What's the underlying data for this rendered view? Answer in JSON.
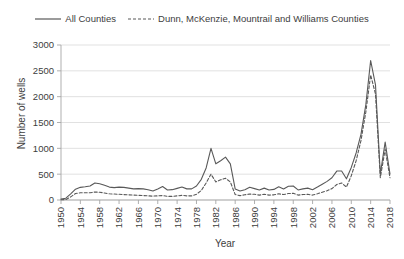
{
  "chart_data": {
    "type": "line",
    "title": "",
    "xlabel": "Year",
    "ylabel": "Number of wells",
    "xlim": [
      1950,
      2018
    ],
    "ylim": [
      0,
      3000
    ],
    "ytick_values": [
      0,
      500,
      1000,
      1500,
      2000,
      2500,
      3000
    ],
    "ytick_labels": [
      "0",
      "500",
      "1000",
      "1500",
      "2000",
      "2500",
      "3000"
    ],
    "xtick_values": [
      1950,
      1954,
      1958,
      1962,
      1966,
      1970,
      1974,
      1978,
      1982,
      1986,
      1990,
      1994,
      1998,
      2002,
      2006,
      2010,
      2014,
      2018
    ],
    "xtick_labels": [
      "1950",
      "1954",
      "1958",
      "1962",
      "1966",
      "1970",
      "1974",
      "1978",
      "1982",
      "1986",
      "1990",
      "1994",
      "1998",
      "2002",
      "2006",
      "2010",
      "2014",
      "2018"
    ],
    "grid": "horizontal",
    "legend_position": "top-center",
    "x": [
      1950,
      1951,
      1952,
      1953,
      1954,
      1955,
      1956,
      1957,
      1958,
      1959,
      1960,
      1961,
      1962,
      1963,
      1964,
      1965,
      1966,
      1967,
      1968,
      1969,
      1970,
      1971,
      1972,
      1973,
      1974,
      1975,
      1976,
      1977,
      1978,
      1979,
      1980,
      1981,
      1982,
      1983,
      1984,
      1985,
      1986,
      1987,
      1988,
      1989,
      1990,
      1991,
      1992,
      1993,
      1994,
      1995,
      1996,
      1997,
      1998,
      1999,
      2000,
      2001,
      2002,
      2003,
      2004,
      2005,
      2006,
      2007,
      2008,
      2009,
      2010,
      2011,
      2012,
      2013,
      2014,
      2015,
      2016,
      2017,
      2018
    ],
    "series": [
      {
        "name": "All Counties",
        "style": "solid",
        "color": "#595959",
        "values": [
          20,
          35,
          120,
          210,
          245,
          255,
          270,
          330,
          315,
          285,
          250,
          240,
          250,
          245,
          230,
          215,
          220,
          215,
          200,
          175,
          215,
          260,
          195,
          200,
          225,
          250,
          215,
          215,
          270,
          400,
          620,
          1000,
          700,
          760,
          830,
          700,
          215,
          175,
          200,
          245,
          220,
          195,
          230,
          195,
          205,
          255,
          215,
          265,
          270,
          195,
          215,
          230,
          200,
          250,
          305,
          360,
          430,
          560,
          560,
          410,
          630,
          910,
          1270,
          1840,
          2700,
          2230,
          500,
          1120,
          500
        ]
      },
      {
        "name": "Dunn, McKenzie, Mountrail and Williams Counties",
        "style": "dashed",
        "color": "#595959",
        "values": [
          5,
          10,
          60,
          125,
          140,
          140,
          140,
          155,
          150,
          135,
          120,
          115,
          110,
          105,
          100,
          95,
          90,
          85,
          80,
          75,
          80,
          85,
          70,
          70,
          80,
          90,
          80,
          80,
          110,
          185,
          330,
          500,
          350,
          390,
          420,
          350,
          105,
          85,
          100,
          115,
          110,
          95,
          110,
          95,
          100,
          120,
          105,
          125,
          130,
          95,
          105,
          110,
          95,
          120,
          150,
          180,
          220,
          300,
          330,
          250,
          470,
          760,
          1150,
          1700,
          2420,
          2050,
          430,
          980,
          430
        ]
      }
    ]
  },
  "legend": {
    "entries": [
      {
        "label": "All Counties",
        "style": "solid"
      },
      {
        "label": "Dunn, McKenzie, Mountrail and Williams Counties",
        "style": "dashed"
      }
    ]
  },
  "axes": {
    "y_title": "Number of wells",
    "x_title": "Year"
  },
  "colors": {
    "line": "#595959",
    "grid": "#d9d9d9",
    "axis": "#a6a6a6",
    "text": "#3d3d3d",
    "background": "#ffffff"
  }
}
